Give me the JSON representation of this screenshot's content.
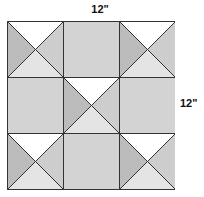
{
  "diagram": {
    "dimensions": {
      "width_label": "12\"",
      "height_label": "12\""
    },
    "grid": {
      "rows": 3,
      "cols": 3
    },
    "colors": {
      "white": "#ffffff",
      "dark": "#bcbcbc",
      "medium": "#cdcdcd",
      "light": "#e4e4e4",
      "solid": "#d3d3d3",
      "line": "#333333"
    },
    "blocks": [
      {
        "row": 0,
        "col": 0,
        "type": "hourglass",
        "top": "white",
        "left": "dark",
        "right": "medium",
        "bottom": "light"
      },
      {
        "row": 0,
        "col": 1,
        "type": "solid"
      },
      {
        "row": 0,
        "col": 2,
        "type": "hourglass",
        "top": "white",
        "left": "dark",
        "right": "medium",
        "bottom": "light"
      },
      {
        "row": 1,
        "col": 0,
        "type": "solid"
      },
      {
        "row": 1,
        "col": 1,
        "type": "hourglass",
        "top": "white",
        "left": "dark",
        "right": "medium",
        "bottom": "light"
      },
      {
        "row": 1,
        "col": 2,
        "type": "solid"
      },
      {
        "row": 2,
        "col": 0,
        "type": "hourglass",
        "top": "white",
        "left": "dark",
        "right": "medium",
        "bottom": "light"
      },
      {
        "row": 2,
        "col": 1,
        "type": "solid"
      },
      {
        "row": 2,
        "col": 2,
        "type": "hourglass",
        "top": "white",
        "left": "dark",
        "right": "medium",
        "bottom": "light"
      }
    ]
  }
}
